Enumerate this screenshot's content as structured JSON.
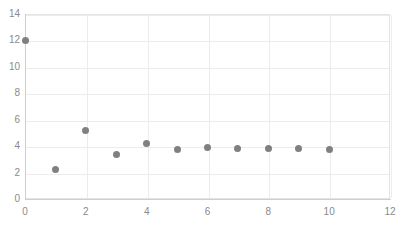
{
  "chart_data": {
    "type": "scatter",
    "title": "",
    "xlabel": "",
    "ylabel": "",
    "xlim": [
      0,
      12
    ],
    "ylim": [
      0,
      14
    ],
    "xticks": [
      0,
      2,
      4,
      6,
      8,
      10,
      12
    ],
    "yticks": [
      0,
      2,
      4,
      6,
      8,
      10,
      12,
      14
    ],
    "xtick_labels": [
      "0",
      "2",
      "4",
      "6",
      "8",
      "10",
      "12"
    ],
    "ytick_labels": [
      "0",
      "2",
      "4",
      "6",
      "8",
      "10",
      "12",
      "14"
    ],
    "grid": true,
    "legend": false,
    "marker_color": "#808080",
    "gridline_color": "#ececec",
    "axis_color": "#cfcfcf",
    "tick_label_color": "#8a8a8a",
    "background_color": "#ffffff",
    "series": [
      {
        "name": "series-1",
        "x": [
          0,
          1,
          2,
          3,
          4,
          5,
          6,
          7,
          8,
          9,
          10
        ],
        "y": [
          12.0,
          2.25,
          5.2,
          3.4,
          4.2,
          3.75,
          3.9,
          3.8,
          3.85,
          3.8,
          3.75
        ]
      }
    ]
  }
}
